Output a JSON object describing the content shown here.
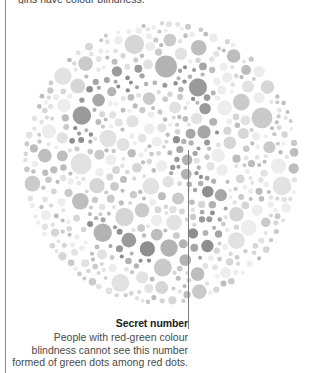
{
  "page": {
    "background_color": "#ffffff",
    "rule_color": "#8d8d8d",
    "overflow_text": "girls have colour blindness."
  },
  "caption": {
    "title": "Secret number",
    "lines": [
      "People with red-green colour",
      "blindness cannot see this number",
      "formed of green dots among red dots."
    ],
    "leader_line_color": "#7c7c7c"
  },
  "chart_data": {
    "type": "scatter",
    "title": "Secret number",
    "subtitle": "Ishihara colour-vision test plate (rendered greyscale)",
    "xlabel": "",
    "ylabel": "",
    "grid": false,
    "legend_position": "none",
    "plate": {
      "center_x": 139,
      "center_y": 144,
      "radius": 139,
      "dot_radius_range": [
        2,
        11
      ],
      "dot_count_estimate": 900,
      "background_dot_colors": [
        "#ededed",
        "#e2e2e2",
        "#d6d6d6",
        "#cacaca",
        "#bdbdbd"
      ],
      "figure_dot_colors": [
        "#b3b3b3",
        "#a6a6a6",
        "#9a9a9a",
        "#8e8e8e"
      ],
      "gap_color": "#ffffff",
      "hidden_numeral": "not legible in greyscale"
    },
    "annotations": [
      {
        "label": "Secret number",
        "target_x": 188,
        "target_y": 150,
        "leader_to_y": 329
      }
    ]
  }
}
